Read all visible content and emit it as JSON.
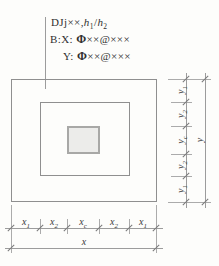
{
  "diagram": {
    "kind": "stepped-independent-foundation-plan-detail",
    "annotation": {
      "line1": {
        "code": "DJj",
        "marks": "××",
        "comma": ",",
        "var1": "h",
        "sub1": "1",
        "slash": "/",
        "var2": "h",
        "sub2": "2"
      },
      "line2": {
        "label": "B:X:",
        "rebar_symbol": "Φ",
        "size_marks": "××",
        "at_sign": "@",
        "spacing_marks": "×××"
      },
      "line3": {
        "label": "Y:",
        "rebar_symbol": "Φ",
        "size_marks": "××",
        "at_sign": "@",
        "spacing_marks": "×××"
      }
    },
    "dimensions": {
      "bottom_segments": [
        {
          "base": "x",
          "sub": "1"
        },
        {
          "base": "x",
          "sub": "2"
        },
        {
          "base": "x",
          "sub": "c"
        },
        {
          "base": "x",
          "sub": "2"
        },
        {
          "base": "x",
          "sub": "1"
        }
      ],
      "bottom_total": {
        "base": "x",
        "sub": ""
      },
      "right_segments": [
        {
          "base": "y",
          "sub": "1"
        },
        {
          "base": "y",
          "sub": "2"
        },
        {
          "base": "y",
          "sub": "c"
        },
        {
          "base": "y",
          "sub": "2"
        },
        {
          "base": "y",
          "sub": "1"
        }
      ],
      "right_total": {
        "base": "y",
        "sub": ""
      }
    },
    "colors": {
      "background": "#fdfdfb",
      "outline": "#8f8f8f",
      "dimension_line": "#9c9c9c",
      "tick": "#7a7a7a",
      "text": "#2f2f2f",
      "column_fill": "#ececea",
      "column_border": "#a8a8a6"
    }
  }
}
